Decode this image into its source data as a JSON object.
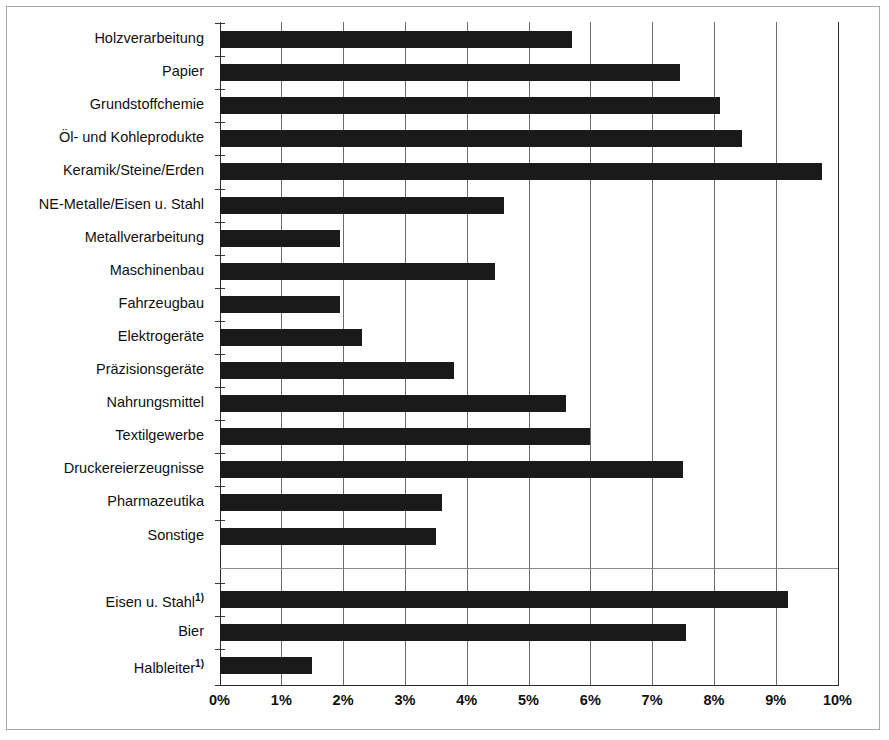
{
  "chart_data": {
    "type": "bar",
    "orientation": "horizontal",
    "title": "",
    "subtitle": "",
    "xlabel": "",
    "ylabel": "",
    "xlim": [
      0,
      10
    ],
    "xtick_labels": [
      "0%",
      "1%",
      "2%",
      "3%",
      "4%",
      "5%",
      "6%",
      "7%",
      "8%",
      "9%",
      "10%"
    ],
    "xtick_values": [
      0,
      1,
      2,
      3,
      4,
      5,
      6,
      7,
      8,
      9,
      10
    ],
    "grid": true,
    "legend": null,
    "bar_color": "#1a1a1a",
    "categories": [
      "Holzverarbeitung",
      "Papier",
      "Grundstoffchemie",
      "Öl- und Kohleprodukte",
      "Keramik/Steine/Erden",
      "NE-Metalle/Eisen u. Stahl",
      "Metallverarbeitung",
      "Maschinenbau",
      "Fahrzeugbau",
      "Elektrogeräte",
      "Präzisionsgeräte",
      "Nahrungsmittel",
      "Textilgewerbe",
      "Druckereierzeugnisse",
      "Pharmazeutika",
      "Sonstige",
      "Eisen u. Stahl",
      "Bier",
      "Halbleiter"
    ],
    "values": [
      5.7,
      7.45,
      8.1,
      8.45,
      9.75,
      4.6,
      1.95,
      4.45,
      1.95,
      2.3,
      3.8,
      5.6,
      6.0,
      7.5,
      3.6,
      3.5,
      9.2,
      7.55,
      1.5
    ],
    "footnote_markers": {
      "Eisen u. Stahl": "1)",
      "Halbleiter": "1)"
    },
    "group_break_after_index": 15,
    "bars": [
      {
        "label": "Holzverarbeitung",
        "value": 5.7,
        "footnote": ""
      },
      {
        "label": "Papier",
        "value": 7.45,
        "footnote": ""
      },
      {
        "label": "Grundstoffchemie",
        "value": 8.1,
        "footnote": ""
      },
      {
        "label": "Öl- und Kohleprodukte",
        "value": 8.45,
        "footnote": ""
      },
      {
        "label": "Keramik/Steine/Erden",
        "value": 9.75,
        "footnote": ""
      },
      {
        "label": "NE-Metalle/Eisen u. Stahl",
        "value": 4.6,
        "footnote": ""
      },
      {
        "label": "Metallverarbeitung",
        "value": 1.95,
        "footnote": ""
      },
      {
        "label": "Maschinenbau",
        "value": 4.45,
        "footnote": ""
      },
      {
        "label": "Fahrzeugbau",
        "value": 1.95,
        "footnote": ""
      },
      {
        "label": "Elektrogeräte",
        "value": 2.3,
        "footnote": ""
      },
      {
        "label": "Präzisionsgeräte",
        "value": 3.8,
        "footnote": ""
      },
      {
        "label": "Nahrungsmittel",
        "value": 5.6,
        "footnote": ""
      },
      {
        "label": "Textilgewerbe",
        "value": 6.0,
        "footnote": ""
      },
      {
        "label": "Druckereierzeugnisse",
        "value": 7.5,
        "footnote": ""
      },
      {
        "label": "Pharmazeutika",
        "value": 3.6,
        "footnote": ""
      },
      {
        "label": "Sonstige",
        "value": 3.5,
        "footnote": ""
      },
      {
        "label": "Eisen u. Stahl",
        "value": 9.2,
        "footnote": "1)"
      },
      {
        "label": "Bier",
        "value": 7.55,
        "footnote": ""
      },
      {
        "label": "Halbleiter",
        "value": 1.5,
        "footnote": "1)"
      }
    ]
  }
}
